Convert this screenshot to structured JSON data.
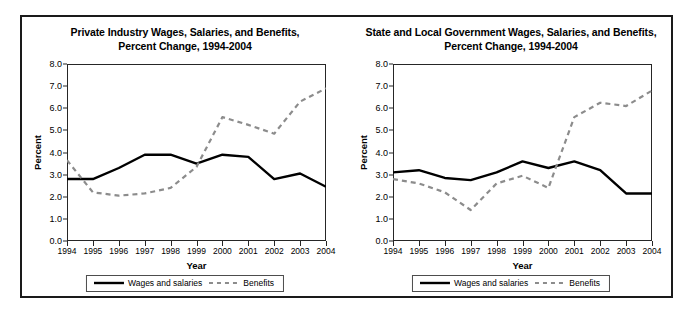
{
  "figure": {
    "panels": [
      {
        "id": "private-industry",
        "title_line1": "Private Industry Wages, Salaries, and Benefits,",
        "title_line2": "Percent Change, 1994-2004"
      },
      {
        "id": "state-local-government",
        "title_line1": "State and Local Government Wages, Salaries, and Benefits,",
        "title_line2": "Percent Change, 1994-2004"
      }
    ],
    "legend": {
      "items": [
        {
          "label": "Wages and salaries",
          "style": "solid",
          "color": "#000000"
        },
        {
          "label": "Benefits",
          "style": "dashed",
          "color": "#8c8c8c"
        }
      ]
    },
    "colors": {
      "wages_line": "#000000",
      "benefits_line": "#8c8c8c",
      "axis": "#262626",
      "frame": "#1a1a1a",
      "background": "#ffffff"
    }
  },
  "chart_data": [
    {
      "type": "line",
      "title": "Private Industry Wages, Salaries, and Benefits, Percent Change, 1994-2004",
      "xlabel": "Year",
      "ylabel": "Percent",
      "x": [
        1994,
        1995,
        1996,
        1997,
        1998,
        1999,
        2000,
        2001,
        2002,
        2003,
        2004
      ],
      "xtick_labels": [
        "1994",
        "1995",
        "1996",
        "1997",
        "1998",
        "1999",
        "2000",
        "2001",
        "2002",
        "2003",
        "2004"
      ],
      "ytick_labels": [
        "0.0",
        "1.0",
        "2.0",
        "3.0",
        "4.0",
        "5.0",
        "6.0",
        "7.0",
        "8.0"
      ],
      "ylim": [
        0.0,
        8.0
      ],
      "ytick_step": 1.0,
      "grid": false,
      "legend_position": "below-plot",
      "series": [
        {
          "name": "Wages and salaries",
          "style": "solid",
          "color": "#000000",
          "values": [
            2.8,
            2.8,
            3.3,
            3.9,
            3.9,
            3.5,
            3.9,
            3.8,
            2.8,
            3.05,
            2.45
          ]
        },
        {
          "name": "Benefits",
          "style": "dashed",
          "color": "#8c8c8c",
          "values": [
            3.65,
            2.2,
            2.05,
            2.15,
            2.4,
            3.35,
            5.6,
            5.25,
            4.85,
            6.3,
            6.9
          ]
        }
      ]
    },
    {
      "type": "line",
      "title": "State and Local Government Wages, Salaries, and Benefits, Percent Change, 1994-2004",
      "xlabel": "Year",
      "ylabel": "Percent",
      "x": [
        1994,
        1995,
        1996,
        1997,
        1998,
        1999,
        2000,
        2001,
        2002,
        2003,
        2004
      ],
      "xtick_labels": [
        "1994",
        "1995",
        "1996",
        "1997",
        "1998",
        "1999",
        "2000",
        "2001",
        "2002",
        "2003",
        "2004"
      ],
      "ytick_labels": [
        "0.0",
        "1.0",
        "2.0",
        "3.0",
        "4.0",
        "5.0",
        "6.0",
        "7.0",
        "8.0"
      ],
      "ylim": [
        0.0,
        8.0
      ],
      "ytick_step": 1.0,
      "grid": false,
      "legend_position": "below-plot",
      "series": [
        {
          "name": "Wages and salaries",
          "style": "solid",
          "color": "#000000",
          "values": [
            3.1,
            3.2,
            2.85,
            2.75,
            3.1,
            3.6,
            3.3,
            3.6,
            3.2,
            2.15,
            2.15
          ]
        },
        {
          "name": "Benefits",
          "style": "dashed",
          "color": "#8c8c8c",
          "values": [
            2.8,
            2.6,
            2.2,
            1.4,
            2.6,
            2.95,
            2.4,
            5.6,
            6.25,
            6.1,
            6.8
          ]
        }
      ]
    }
  ]
}
